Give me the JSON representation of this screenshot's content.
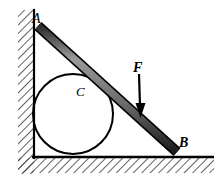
{
  "figure": {
    "type": "statics-free-body-diagram",
    "background_color": "#ffffff",
    "stroke_color": "#000000",
    "bar_fill_color": "#5a5a5a",
    "bar_highlight_color": "#8f8f8f",
    "hatch_color": "#3a3a3a",
    "labels": {
      "point_a": "A",
      "point_b": "B",
      "center_c": "C",
      "force_f": "F"
    },
    "geometry": {
      "wall": {
        "x": 34,
        "top_y": 10,
        "bottom_y": 157,
        "thickness": 2,
        "hatch_width": 16,
        "hatch_side": "left"
      },
      "floor": {
        "y": 157,
        "left_x": 33,
        "right_x": 214,
        "thickness": 2,
        "hatch_height": 16,
        "hatch_side": "below"
      },
      "bar": {
        "start_x": 38,
        "start_y": 26,
        "end_x": 177,
        "end_y": 152,
        "thickness": 8
      },
      "circle": {
        "cx": 73,
        "cy": 114,
        "r": 40,
        "stroke_width": 2,
        "fill": "none"
      },
      "force_arrow": {
        "from_x": 139,
        "from_y": 74,
        "to_x": 141,
        "to_y": 117,
        "shaft_width": 2,
        "head_width": 9,
        "head_length": 12,
        "direction": "down"
      }
    }
  }
}
